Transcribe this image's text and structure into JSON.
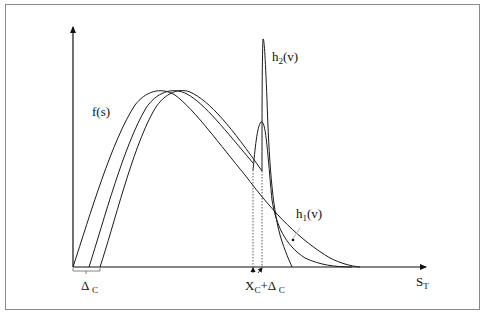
{
  "figure": {
    "type": "schematic probability density diagram",
    "frame_color": "#8a8a8a",
    "line_color": "#1a1a1a",
    "labels": {
      "f_s": {
        "main": "f(s)"
      },
      "h2_v": {
        "main": "h",
        "sub": "2",
        "rest": "(v)"
      },
      "h1_v": {
        "main": "h",
        "sub": "1",
        "rest": "(v)"
      },
      "delta_c": {
        "main": "Δ",
        "sub": "C"
      },
      "xc_plus_delta": {
        "main": "X",
        "sub": "C",
        "mid": "+Δ",
        "sub2": "C"
      },
      "x_axis": {
        "main": "S",
        "sub": "T"
      }
    },
    "axes": {
      "x_axis_label": "S_T",
      "y_axis_label": "",
      "origin_px": [
        73,
        267
      ]
    },
    "curves": [
      {
        "name": "f(s) unshifted",
        "description": "skewed hump starting at origin, peak near x=152"
      },
      {
        "name": "f(s) shifted by Δc",
        "description": "same hump shifted right"
      },
      {
        "name": "f(s) shifted by 2Δc",
        "description": "same hump shifted right again"
      },
      {
        "name": "h1(v)",
        "description": "smaller spike at X_C then long right tail"
      },
      {
        "name": "h2(v)",
        "description": "tall narrow spike at X_C+Δ_C"
      }
    ],
    "markers": {
      "dotted_verticals": [
        "X_C",
        "X_C+Δ_C"
      ]
    }
  }
}
